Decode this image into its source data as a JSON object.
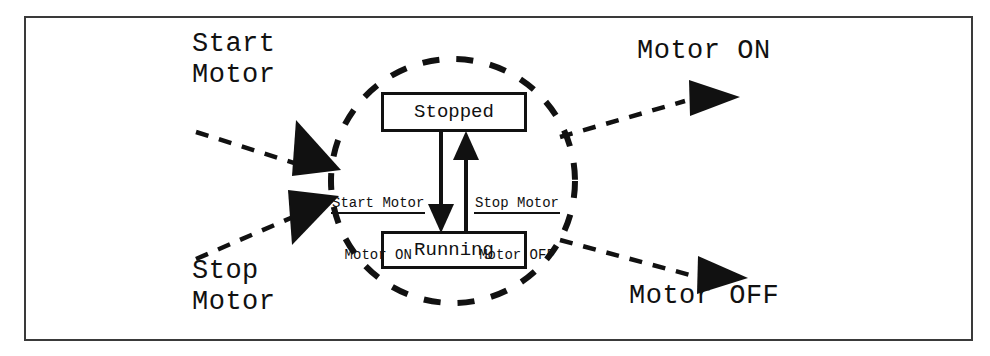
{
  "diagram": {
    "boundary": {
      "name": "system-boundary",
      "shape": "dashed-circle"
    },
    "states": [
      {
        "id": "stopped",
        "label": "Stopped"
      },
      {
        "id": "running",
        "label": "Running"
      }
    ],
    "transitions": [
      {
        "id": "stopped-to-running",
        "trigger": "Start Motor",
        "action": "Motor ON",
        "from": "Stopped",
        "to": "Running"
      },
      {
        "id": "running-to-stopped",
        "trigger": "Stop Motor",
        "action": "Motor OFF",
        "from": "Running",
        "to": "Stopped"
      }
    ],
    "external": {
      "inputs": [
        {
          "id": "start-motor-input",
          "label": "Start\nMotor"
        },
        {
          "id": "stop-motor-input",
          "label": "Stop\nMotor"
        }
      ],
      "outputs": [
        {
          "id": "motor-on-output",
          "label": "Motor ON"
        },
        {
          "id": "motor-off-output",
          "label": "Motor OFF"
        }
      ]
    },
    "colors": {
      "ink": "#111111",
      "frame": "#3a3a3a",
      "background": "#ffffff"
    }
  }
}
